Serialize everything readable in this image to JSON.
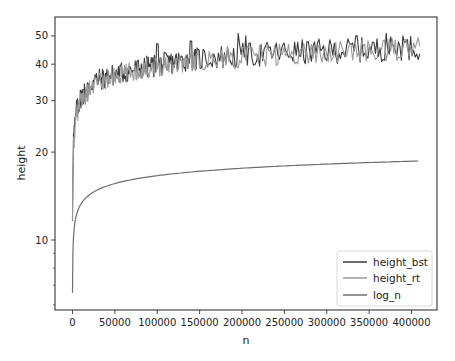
{
  "chart_data": {
    "type": "line",
    "title": "",
    "xlabel": "n",
    "ylabel": "height",
    "yscale": "log",
    "xlim": [
      -20000,
      430000
    ],
    "ylim": [
      5.8,
      56
    ],
    "grid": false,
    "legend_position": "lower right",
    "x_ticks": [
      0,
      50000,
      100000,
      150000,
      200000,
      250000,
      300000,
      350000,
      400000
    ],
    "x_tick_labels": [
      "0",
      "50000",
      "100000",
      "150000",
      "200000",
      "250000",
      "300000",
      "350000",
      "400000"
    ],
    "y_ticks": [
      10,
      20,
      30,
      40,
      50
    ],
    "y_tick_labels": [
      "10",
      "20",
      "30",
      "40",
      "50"
    ],
    "y_minor_ticks": [
      6,
      7,
      8,
      9
    ],
    "series": [
      {
        "name": "height_bst",
        "color": "#3a3a3a",
        "description": "noisy height of binary search tree vs n",
        "trend_x": [
          0,
          1000,
          5000,
          10000,
          25000,
          50000,
          100000,
          150000,
          200000,
          250000,
          300000,
          350000,
          410000
        ],
        "trend_y": [
          12,
          22,
          28,
          31,
          35,
          37,
          40,
          42,
          43,
          44,
          44.5,
          45,
          46
        ],
        "noise_amplitude": 0.09,
        "peaks": [
          [
            100000,
            47
          ],
          [
            140000,
            48
          ],
          [
            195000,
            51
          ],
          [
            205000,
            50
          ],
          [
            335000,
            50
          ],
          [
            370000,
            51
          ],
          [
            390000,
            50
          ]
        ]
      },
      {
        "name": "height_rt",
        "color": "#9a9a9a",
        "description": "noisy height of random tree vs n",
        "trend_x": [
          0,
          1000,
          5000,
          10000,
          25000,
          50000,
          100000,
          150000,
          200000,
          250000,
          300000,
          350000,
          410000
        ],
        "trend_y": [
          11,
          21,
          27,
          30,
          34,
          36.5,
          39.5,
          41.5,
          42.5,
          43.5,
          44,
          44.5,
          45.5
        ],
        "noise_amplitude": 0.08,
        "peaks": []
      },
      {
        "name": "log_n",
        "color": "#6e6e6e",
        "description": "log2(n)",
        "x": [
          100,
          2000,
          5000,
          10000,
          25000,
          50000,
          100000,
          150000,
          200000,
          250000,
          300000,
          350000,
          410000
        ],
        "y": [
          6.6,
          11.0,
          12.3,
          13.3,
          14.6,
          15.6,
          16.6,
          17.2,
          17.6,
          17.9,
          18.2,
          18.4,
          18.6
        ]
      }
    ]
  },
  "legend": {
    "items": [
      {
        "label": "height_bst",
        "color": "#3a3a3a"
      },
      {
        "label": "height_rt",
        "color": "#9a9a9a"
      },
      {
        "label": "log_n",
        "color": "#6e6e6e"
      }
    ]
  },
  "axes": {
    "xlabel": "n",
    "ylabel": "height"
  }
}
